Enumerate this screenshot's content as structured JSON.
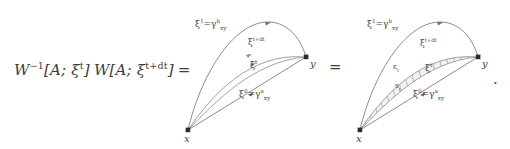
{
  "equation": {
    "lhs_prefix": "W",
    "lhs_exponent": "−1",
    "lhs_bracket_1": "[A; ξ",
    "lhs_sup_1": "t",
    "lhs_close_1": "]",
    "lhs_w2": "W",
    "lhs_bracket_2": "[A; ξ",
    "lhs_sup_2": "t+dt",
    "lhs_close_2": "]",
    "lhs_equals": "=",
    "middle_equals": "=",
    "trailing_period": "."
  },
  "figures": [
    {
      "id": "figure-left",
      "name": "two-path-diagram",
      "vertices": [
        {
          "name": "x",
          "label": "x"
        },
        {
          "name": "y",
          "label": "y"
        }
      ],
      "curves": [
        {
          "name": "xi-1-upper-geodesic",
          "label_main": "ξ",
          "label_sup": "1",
          "label_eq": "=",
          "label_gamma": "γ",
          "label_gamma_sup": "b",
          "label_gamma_sub": "xy"
        },
        {
          "name": "xi-t-plus-dt",
          "label_main": "ξ",
          "label_sup": "t+dt"
        },
        {
          "name": "xi-t",
          "label_main": "ξ",
          "label_sup": "t"
        },
        {
          "name": "xi-0-lower-geodesic",
          "label_main": "ξ",
          "label_sup": "0",
          "label_eq": "=",
          "label_gamma": "γ",
          "label_gamma_sup": "a",
          "label_gamma_sub": "xy"
        }
      ]
    },
    {
      "id": "figure-right",
      "name": "hatched-ribbon-diagram",
      "vertices": [
        {
          "name": "x",
          "label": "x"
        },
        {
          "name": "y",
          "label": "y"
        }
      ],
      "curves": [
        {
          "name": "xi-1-upper-geodesic",
          "label_main": "ξ",
          "label_sup": "1",
          "label_eq": "=",
          "label_gamma": "γ",
          "label_gamma_sup": "b",
          "label_gamma_sub": "xy"
        },
        {
          "name": "xi-t-plus-dt",
          "label_main": "ξ",
          "label_sup": "t+dt"
        },
        {
          "name": "xi-t",
          "label_main": "ξ",
          "label_sup": "t"
        },
        {
          "name": "xi-0-lower-geodesic",
          "label_main": "ξ",
          "label_sup": "0",
          "label_eq": "=",
          "label_gamma": "γ",
          "label_gamma_sup": "a",
          "label_gamma_sub": "xy"
        }
      ],
      "ribbon": {
        "name": "hatched-surface-element",
        "label_epsilon": "ε",
        "label_epsilon_sub": "t",
        "label_s": "s",
        "label_s_sub": "t"
      }
    }
  ],
  "colors": {
    "ink": "#3d3d3d",
    "curve": "#6e6e6e",
    "curve_light": "#9a9a9a",
    "vertex": "#2b2b2b",
    "hatch": "#8d8d8d"
  }
}
